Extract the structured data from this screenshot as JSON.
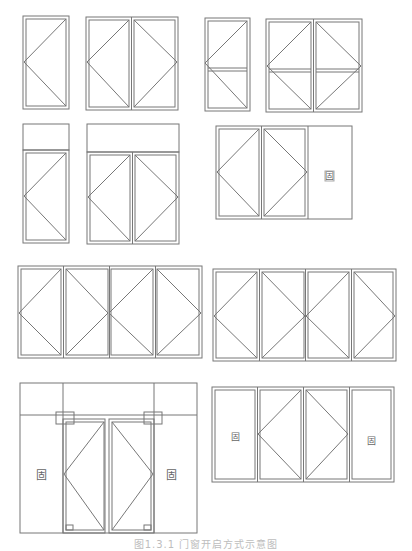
{
  "stroke_color": "#777777",
  "fixed_label": "固",
  "caption": "图1.3.1 门窗开启方式示意图",
  "figures": [
    {
      "id": "single-casement",
      "panels": 1,
      "description": "Single leaf casement, hinge on left apex"
    },
    {
      "id": "double-casement",
      "panels": 2,
      "description": "Double leaf casement, outward apex"
    },
    {
      "id": "single-casement-transom-split",
      "panels": 1,
      "description": "Single leaf with horizontal mullion"
    },
    {
      "id": "double-casement-transom-split",
      "panels": 2,
      "description": "Double leaf with horizontal mullion"
    },
    {
      "id": "single-door-with-transom",
      "panels": 1,
      "description": "Single door with fixed transom above"
    },
    {
      "id": "double-door-with-transom",
      "panels": 2,
      "description": "Double door with fixed transom above"
    },
    {
      "id": "double-casement-plus-fixed",
      "panels": 3,
      "description": "Two casements plus one fixed panel",
      "fixed_label": "固"
    },
    {
      "id": "four-panel-casement-a",
      "panels": 4,
      "description": "Four-leaf folding casement"
    },
    {
      "id": "four-panel-casement-b",
      "panels": 4,
      "description": "Four-leaf folding casement"
    },
    {
      "id": "glass-door-with-fixed-sides",
      "panels": 4,
      "description": "Double glass door flanked by fixed panels",
      "fixed_labels": [
        "固",
        "固"
      ]
    },
    {
      "id": "double-casement-with-fixed-sides",
      "panels": 4,
      "description": "Two casements flanked by fixed panels",
      "fixed_labels": [
        "固",
        "固"
      ]
    }
  ]
}
